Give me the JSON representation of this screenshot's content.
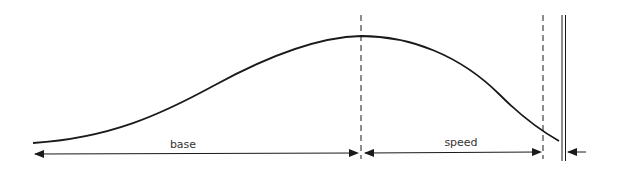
{
  "diagram": {
    "labels": {
      "base": "base",
      "speed": "speed"
    },
    "colors": {
      "stroke": "#1a1a1a",
      "background": "#ffffff"
    },
    "elements": {
      "curve": "bell-shaped velocity curve rising to peak then falling",
      "dashed_lines": [
        "peak marker",
        "end-of-speed marker"
      ],
      "double_line": "boundary wall"
    }
  }
}
